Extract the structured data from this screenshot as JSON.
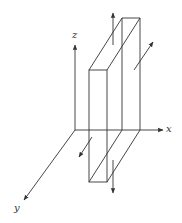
{
  "diagram": {
    "axes": {
      "x_label": "x",
      "y_label": "y",
      "z_label": "z"
    },
    "colors": {
      "line": "#333333",
      "background": "#ffffff"
    },
    "arrows": [
      {
        "id": "top-arrow",
        "direction": "+z"
      },
      {
        "id": "bottom-arrow",
        "direction": "-z"
      },
      {
        "id": "right-arrow",
        "direction": "-y (into page)"
      },
      {
        "id": "left-arrow",
        "direction": "+y (out of page)"
      }
    ]
  }
}
